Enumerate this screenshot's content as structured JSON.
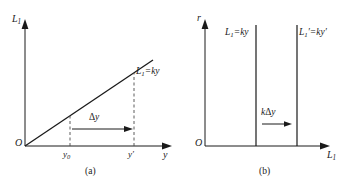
{
  "figure": {
    "panels": [
      {
        "id": "a",
        "caption": "(a)",
        "y_axis_label": "L",
        "y_axis_sub": "1",
        "x_axis_label": "y",
        "origin_label": "O",
        "line_label_main": "L",
        "line_label_sub": "1",
        "line_label_rest": "=ky",
        "tick_labels": [
          {
            "base": "y",
            "sub": "0",
            "prime": ""
          },
          {
            "base": "y",
            "sub": "",
            "prime": "′"
          }
        ],
        "shift_label_symbol": "Δ",
        "shift_label_var": "y",
        "arrow_icon": "right-arrow-icon"
      },
      {
        "id": "b",
        "caption": "(b)",
        "y_axis_label": "r",
        "x_axis_label": "L",
        "x_axis_sub": "1",
        "origin_label": "O",
        "line_labels": [
          {
            "base": "L",
            "sub": "1",
            "prime": "",
            "rest": "=ky",
            "rest_prime": ""
          },
          {
            "base": "L",
            "sub": "1",
            "prime": "′",
            "rest": "=ky",
            "rest_prime": "′"
          }
        ],
        "shift_label_k": "k",
        "shift_label_symbol": "Δ",
        "shift_label_var": "y",
        "arrow_icon": "right-arrow-icon"
      }
    ],
    "colors": {
      "stroke": "#1a1a1a",
      "background": "#ffffff",
      "dashed": "#4a4a4a"
    }
  }
}
